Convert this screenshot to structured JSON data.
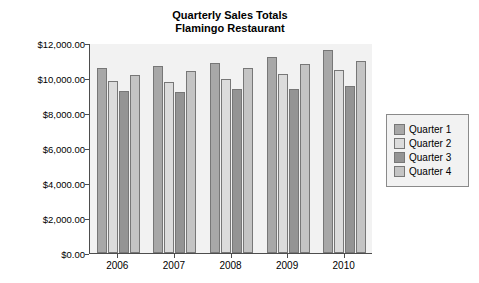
{
  "chart_data": {
    "type": "bar",
    "title": "Quarterly Sales Totals",
    "subtitle": "Flamingo Restaurant",
    "xlabel": "",
    "ylabel": "",
    "categories": [
      "2006",
      "2007",
      "2008",
      "2009",
      "2010"
    ],
    "series": [
      {
        "name": "Quarter 1",
        "color": "#a8a8a8",
        "values": [
          10600,
          10700,
          10850,
          11200,
          11600
        ]
      },
      {
        "name": "Quarter 2",
        "color": "#dcdcdc",
        "values": [
          9850,
          9800,
          9950,
          10250,
          10450
        ]
      },
      {
        "name": "Quarter 3",
        "color": "#949494",
        "values": [
          9250,
          9200,
          9350,
          9400,
          9550
        ]
      },
      {
        "name": "Quarter 4",
        "color": "#c4c4c4",
        "values": [
          10150,
          10400,
          10600,
          10800,
          10950
        ]
      }
    ],
    "ylim": [
      0,
      12000
    ],
    "ytick_values": [
      0,
      2000,
      4000,
      6000,
      8000,
      10000,
      12000
    ],
    "ytick_labels": [
      "$0.00",
      "$2,000.00",
      "$4,000.00",
      "$6,000.00",
      "$8,000.00",
      "$10,000.00",
      "$12,000.00"
    ],
    "grid": false,
    "legend_position": "right",
    "legend_entries": [
      "Quarter 1",
      "Quarter 2",
      "Quarter 3",
      "Quarter 4"
    ],
    "plot_background": "#f2f2f2",
    "axis_color": "#4d4d4d"
  }
}
